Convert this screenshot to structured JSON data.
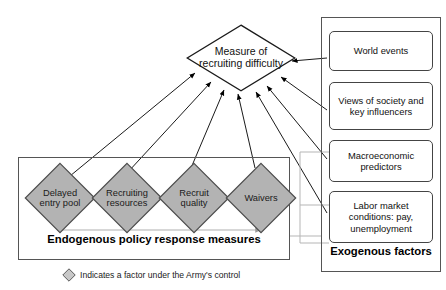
{
  "diagram": {
    "title_node": {
      "label": "Measure of recruiting difficulty",
      "shape": "diamond",
      "fill": "#ffffff"
    },
    "endogenous": {
      "caption": "Endogenous policy response measures",
      "nodes": [
        {
          "label": "Delayed entry pool",
          "shape": "diamond",
          "fill": "#b3b3b3"
        },
        {
          "label": "Recruiting resources",
          "shape": "diamond",
          "fill": "#b3b3b3"
        },
        {
          "label": "Recruit quality",
          "shape": "diamond",
          "fill": "#b3b3b3"
        },
        {
          "label": "Waivers",
          "shape": "diamond",
          "fill": "#b3b3b3"
        }
      ]
    },
    "exogenous": {
      "caption": "Exogenous factors",
      "nodes": [
        {
          "label": "World events",
          "shape": "rounded-rect",
          "fill": "#ffffff"
        },
        {
          "label": "Views of society and key influencers",
          "shape": "rounded-rect",
          "fill": "#ffffff"
        },
        {
          "label": "Macroeconomic predictors",
          "shape": "rounded-rect",
          "fill": "#ffffff"
        },
        {
          "label": "Labor market conditions: pay, unemployment",
          "shape": "rounded-rect",
          "fill": "#ffffff"
        }
      ]
    },
    "legend": {
      "text": "Indicates a factor under the Army's control",
      "swatch_shape": "diamond",
      "swatch_fill": "#c8c8c8"
    },
    "colors": {
      "node_fill_gray": "#b3b3b3",
      "node_stroke": "#4d4d4d",
      "arrow_black": "#000000",
      "arrow_gray": "#9a9a9a",
      "frame_stroke": "#555555",
      "text": "#1a1a1a"
    }
  }
}
